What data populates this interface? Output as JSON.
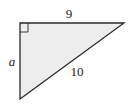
{
  "diagram": {
    "type": "right-triangle",
    "fill_color": "#ededed",
    "stroke_color": "#2a2a2a",
    "labels": {
      "top_side": "9",
      "left_side": "a",
      "hypotenuse": "10"
    },
    "right_angle_marker": true
  }
}
